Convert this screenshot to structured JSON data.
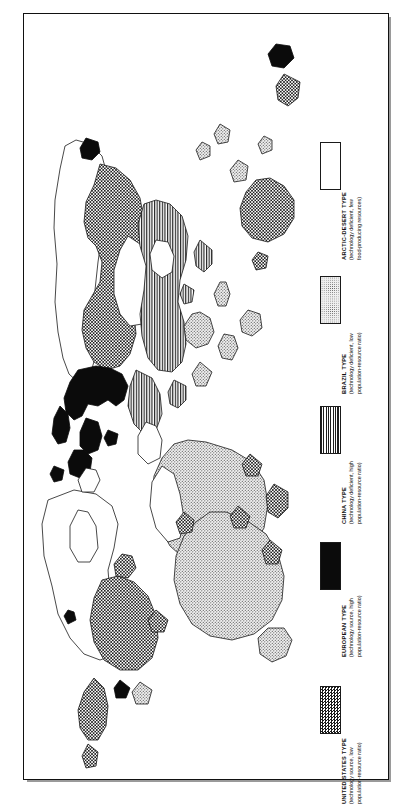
{
  "figure": {
    "kind": "thematic-world-map",
    "orientation": "rotated-90-ccw",
    "frame_border_color": "#111111",
    "background_color": "#ffffff"
  },
  "legend": {
    "title": "",
    "entries": [
      {
        "key": "arctic-desert",
        "title": "ARCTIC-DESERT TYPE",
        "sub_line_1": "(technology deficient, few",
        "sub_line_2": "food-producing resources)",
        "pattern": "blank",
        "swatch_fill_color": "#ffffff",
        "swatch_border_color": "#1a1a1a"
      },
      {
        "key": "brazil",
        "title": "BRAZIL TYPE",
        "sub_line_1": "(technology deficient, low",
        "sub_line_2": "population-resource ratio)",
        "pattern": "fine-dots",
        "swatch_fill_color": "#efefef",
        "swatch_border_color": "#1a1a1a"
      },
      {
        "key": "china",
        "title": "CHINA TYPE",
        "sub_line_1": "(technology deficient, high",
        "sub_line_2": "population-resource ratio)",
        "pattern": "vertical-lines",
        "swatch_fill_color": "#ffffff",
        "swatch_border_color": "#1a1a1a"
      },
      {
        "key": "european",
        "title": "EUROPEAN TYPE",
        "sub_line_1": "(technology source, high",
        "sub_line_2": "population-resource ratio)",
        "pattern": "solid-black",
        "swatch_fill_color": "#0b0b0b",
        "swatch_border_color": "#1a1a1a"
      },
      {
        "key": "united-states",
        "title": "UNITED STATES TYPE",
        "sub_line_1": "(technology source, low",
        "sub_line_2": "population-resource ratio)",
        "pattern": "checkerboard",
        "swatch_fill_color": "#1b1b1b",
        "swatch_border_color": "#1a1a1a"
      }
    ]
  },
  "map_regions": [
    {
      "name": "north-america-usa",
      "pattern": "checkerboard"
    },
    {
      "name": "canada-arctic",
      "pattern": "blank"
    },
    {
      "name": "greenland",
      "pattern": "blank"
    },
    {
      "name": "mexico-central-america",
      "pattern": "fine-dots"
    },
    {
      "name": "south-america-brazil",
      "pattern": "fine-dots"
    },
    {
      "name": "caribbean-islands",
      "pattern": "checkerboard"
    },
    {
      "name": "western-europe",
      "pattern": "solid-black"
    },
    {
      "name": "british-isles",
      "pattern": "solid-black"
    },
    {
      "name": "scandinavia",
      "pattern": "solid-black"
    },
    {
      "name": "soviet-union-russia",
      "pattern": "checkerboard"
    },
    {
      "name": "china-east-asia",
      "pattern": "vertical-lines"
    },
    {
      "name": "india-south-asia",
      "pattern": "vertical-lines"
    },
    {
      "name": "japan",
      "pattern": "vertical-lines"
    },
    {
      "name": "southeast-asia-islands",
      "pattern": "fine-dots"
    },
    {
      "name": "africa",
      "pattern": "fine-dots"
    },
    {
      "name": "north-africa-sahara",
      "pattern": "blank"
    },
    {
      "name": "arabia",
      "pattern": "blank"
    },
    {
      "name": "australia",
      "pattern": "checkerboard"
    },
    {
      "name": "new-zealand",
      "pattern": "checkerboard"
    }
  ]
}
